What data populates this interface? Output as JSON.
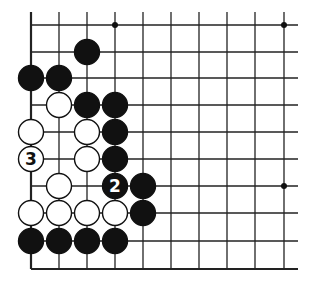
{
  "diagram": {
    "type": "go-board",
    "grid": {
      "x": [
        31,
        59,
        87,
        115,
        143,
        171,
        199,
        227,
        255,
        284
      ],
      "y": [
        25,
        52,
        78,
        105,
        132,
        159,
        186,
        213,
        241,
        269
      ],
      "top_extension": 13,
      "right_extension": 14,
      "line_color": "#222222",
      "edge": "bottom-left"
    },
    "stone_radius": 12.5,
    "star_points": [
      [
        3,
        0
      ],
      [
        9,
        0
      ],
      [
        9,
        6
      ]
    ],
    "stones": [
      {
        "color": "black",
        "col": 2,
        "row": 1,
        "label": ""
      },
      {
        "color": "black",
        "col": 0,
        "row": 2,
        "label": ""
      },
      {
        "color": "black",
        "col": 1,
        "row": 2,
        "label": ""
      },
      {
        "color": "white",
        "col": 1,
        "row": 3,
        "label": ""
      },
      {
        "color": "black",
        "col": 2,
        "row": 3,
        "label": ""
      },
      {
        "color": "black",
        "col": 3,
        "row": 3,
        "label": ""
      },
      {
        "color": "white",
        "col": 0,
        "row": 4,
        "label": ""
      },
      {
        "color": "white",
        "col": 2,
        "row": 4,
        "label": ""
      },
      {
        "color": "black",
        "col": 3,
        "row": 4,
        "label": ""
      },
      {
        "color": "white",
        "col": 0,
        "row": 5,
        "label": "3"
      },
      {
        "color": "white",
        "col": 2,
        "row": 5,
        "label": ""
      },
      {
        "color": "black",
        "col": 3,
        "row": 5,
        "label": ""
      },
      {
        "color": "white",
        "col": 1,
        "row": 6,
        "label": ""
      },
      {
        "color": "black",
        "col": 3,
        "row": 6,
        "label": "2"
      },
      {
        "color": "black",
        "col": 4,
        "row": 6,
        "label": ""
      },
      {
        "color": "white",
        "col": 0,
        "row": 7,
        "label": ""
      },
      {
        "color": "white",
        "col": 1,
        "row": 7,
        "label": ""
      },
      {
        "color": "white",
        "col": 2,
        "row": 7,
        "label": ""
      },
      {
        "color": "white",
        "col": 3,
        "row": 7,
        "label": ""
      },
      {
        "color": "black",
        "col": 4,
        "row": 7,
        "label": ""
      },
      {
        "color": "black",
        "col": 0,
        "row": 8,
        "label": ""
      },
      {
        "color": "black",
        "col": 1,
        "row": 8,
        "label": ""
      },
      {
        "color": "black",
        "col": 2,
        "row": 8,
        "label": ""
      },
      {
        "color": "black",
        "col": 3,
        "row": 8,
        "label": ""
      }
    ],
    "move_labels": [
      "2",
      "3"
    ]
  }
}
